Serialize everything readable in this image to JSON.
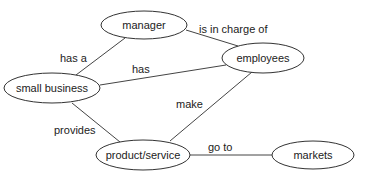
{
  "diagram": {
    "type": "concept-map",
    "nodes": [
      {
        "id": "manager",
        "label": "manager",
        "cx": 144,
        "cy": 25,
        "rx": 43,
        "ry": 14
      },
      {
        "id": "small_business",
        "label": "small business",
        "cx": 52,
        "cy": 88,
        "rx": 48,
        "ry": 15
      },
      {
        "id": "employees",
        "label": "employees",
        "cx": 263,
        "cy": 58,
        "rx": 41,
        "ry": 15
      },
      {
        "id": "product_service",
        "label": "product/service",
        "cx": 143,
        "cy": 155,
        "rx": 47,
        "ry": 15
      },
      {
        "id": "markets",
        "label": "markets",
        "cx": 313,
        "cy": 155,
        "rx": 41,
        "ry": 14
      }
    ],
    "edges": [
      {
        "from": "small_business",
        "to": "manager",
        "label": "has a"
      },
      {
        "from": "manager",
        "to": "employees",
        "label": "is in charge of"
      },
      {
        "from": "small_business",
        "to": "employees",
        "label": "has"
      },
      {
        "from": "employees",
        "to": "product_service",
        "label": "make"
      },
      {
        "from": "small_business",
        "to": "product_service",
        "label": "provides"
      },
      {
        "from": "product_service",
        "to": "markets",
        "label": "go to"
      }
    ]
  }
}
